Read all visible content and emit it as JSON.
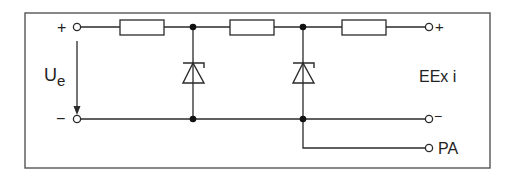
{
  "diagram": {
    "type": "circuit-schematic",
    "input": {
      "plus_label": "+",
      "minus_label": "−",
      "voltage_label": "U",
      "voltage_subscript": "e"
    },
    "output": {
      "plus_label": "+",
      "minus_label": "−",
      "pa_label": "PA",
      "zone_label": "EEx i"
    },
    "components": [
      {
        "id": "R1",
        "type": "resistor"
      },
      {
        "id": "D1",
        "type": "zener-diode"
      },
      {
        "id": "R2",
        "type": "resistor"
      },
      {
        "id": "D2",
        "type": "zener-diode"
      },
      {
        "id": "R3",
        "type": "resistor"
      }
    ],
    "colors": {
      "line": "#2a2a2a",
      "frame": "#555555",
      "background": "#ffffff"
    }
  }
}
